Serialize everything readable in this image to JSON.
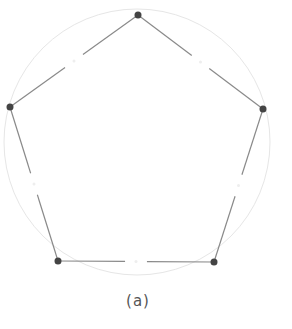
{
  "diagram": {
    "caption": "(a)",
    "circle": {
      "cx": 137,
      "cy": 142,
      "r": 133,
      "color": "#e6e6e6"
    },
    "vertices": [
      {
        "id": "top",
        "x": 138,
        "y": 15
      },
      {
        "id": "right",
        "x": 263,
        "y": 109
      },
      {
        "id": "bottom-right",
        "x": 214,
        "y": 262
      },
      {
        "id": "bottom-left",
        "x": 58,
        "y": 261
      },
      {
        "id": "left",
        "x": 10,
        "y": 107
      }
    ],
    "edge_color": "#8a8a8a",
    "vertex_color": "#444444",
    "midpoint_gap": true
  }
}
